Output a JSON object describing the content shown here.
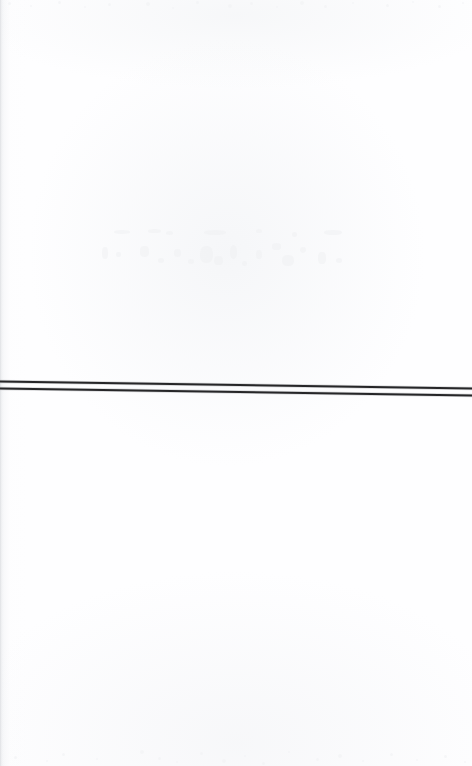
{
  "document": {
    "kind": "scanned-page",
    "page_background": "#fefeff",
    "width": 472,
    "height": 766,
    "visible_text": "",
    "note_text": ""
  },
  "rules": {
    "stroke_color": "#262628",
    "halo_color": "#b9babd",
    "count": 2,
    "lines": [
      {
        "name": "upper-rule",
        "x1": 0,
        "y1": 381.5,
        "x2": 472,
        "y2": 388.5,
        "thickness": 2.1
      },
      {
        "name": "lower-rule",
        "x1": 0,
        "y1": 388.5,
        "x2": 472,
        "y2": 395.5,
        "thickness": 2.1
      }
    ]
  },
  "artifacts": {
    "edge_strip_color": "#d6d8dc",
    "bleed_color": "#f0f1f3",
    "speckle_color": "#f1f2f4",
    "bleed_marks": [
      {
        "x": 18,
        "y": 2,
        "w": 16,
        "h": 4
      },
      {
        "x": 52,
        "y": 1,
        "w": 13,
        "h": 4
      },
      {
        "x": 70,
        "y": 3,
        "w": 7,
        "h": 4
      },
      {
        "x": 108,
        "y": 2,
        "w": 22,
        "h": 5
      },
      {
        "x": 160,
        "y": 1,
        "w": 6,
        "h": 4
      },
      {
        "x": 196,
        "y": 4,
        "w": 5,
        "h": 5
      },
      {
        "x": 228,
        "y": 2,
        "w": 18,
        "h": 5
      },
      {
        "x": 6,
        "y": 19,
        "w": 6,
        "h": 12
      },
      {
        "x": 20,
        "y": 24,
        "w": 5,
        "h": 5
      },
      {
        "x": 44,
        "y": 18,
        "w": 9,
        "h": 11
      },
      {
        "x": 62,
        "y": 30,
        "w": 6,
        "h": 5
      },
      {
        "x": 78,
        "y": 21,
        "w": 7,
        "h": 8
      },
      {
        "x": 92,
        "y": 31,
        "w": 6,
        "h": 5
      },
      {
        "x": 104,
        "y": 18,
        "w": 13,
        "h": 17
      },
      {
        "x": 118,
        "y": 28,
        "w": 9,
        "h": 9
      },
      {
        "x": 134,
        "y": 17,
        "w": 7,
        "h": 14
      },
      {
        "x": 146,
        "y": 33,
        "w": 5,
        "h": 5
      },
      {
        "x": 160,
        "y": 22,
        "w": 6,
        "h": 9
      },
      {
        "x": 176,
        "y": 15,
        "w": 9,
        "h": 7
      },
      {
        "x": 186,
        "y": 27,
        "w": 12,
        "h": 11
      },
      {
        "x": 204,
        "y": 19,
        "w": 6,
        "h": 6
      },
      {
        "x": 222,
        "y": 24,
        "w": 8,
        "h": 12
      },
      {
        "x": 240,
        "y": 30,
        "w": 6,
        "h": 5
      }
    ],
    "top_speckles": [
      {
        "x": 8,
        "y": 2,
        "d": 3
      },
      {
        "x": 30,
        "y": 5,
        "d": 2
      },
      {
        "x": 58,
        "y": 1,
        "d": 3
      },
      {
        "x": 84,
        "y": 6,
        "d": 2
      },
      {
        "x": 108,
        "y": 3,
        "d": 3
      },
      {
        "x": 146,
        "y": 2,
        "d": 4
      },
      {
        "x": 172,
        "y": 7,
        "d": 2
      },
      {
        "x": 196,
        "y": 1,
        "d": 3
      },
      {
        "x": 228,
        "y": 4,
        "d": 4
      },
      {
        "x": 250,
        "y": 2,
        "d": 3
      },
      {
        "x": 276,
        "y": 6,
        "d": 2
      },
      {
        "x": 300,
        "y": 1,
        "d": 4
      },
      {
        "x": 324,
        "y": 5,
        "d": 3
      },
      {
        "x": 352,
        "y": 2,
        "d": 2
      },
      {
        "x": 386,
        "y": 4,
        "d": 3
      },
      {
        "x": 412,
        "y": 1,
        "d": 2
      },
      {
        "x": 438,
        "y": 5,
        "d": 3
      },
      {
        "x": 462,
        "y": 2,
        "d": 2
      }
    ],
    "bottom_speckles": [
      {
        "x": 14,
        "y": 16,
        "d": 3
      },
      {
        "x": 46,
        "y": 20,
        "d": 2
      },
      {
        "x": 62,
        "y": 13,
        "d": 3
      },
      {
        "x": 96,
        "y": 18,
        "d": 2
      },
      {
        "x": 140,
        "y": 10,
        "d": 4
      },
      {
        "x": 158,
        "y": 17,
        "d": 3
      },
      {
        "x": 176,
        "y": 21,
        "d": 2
      },
      {
        "x": 200,
        "y": 12,
        "d": 3
      },
      {
        "x": 222,
        "y": 19,
        "d": 4
      },
      {
        "x": 244,
        "y": 15,
        "d": 2
      },
      {
        "x": 262,
        "y": 22,
        "d": 3
      },
      {
        "x": 288,
        "y": 11,
        "d": 2
      },
      {
        "x": 316,
        "y": 18,
        "d": 3
      },
      {
        "x": 338,
        "y": 14,
        "d": 4
      },
      {
        "x": 362,
        "y": 20,
        "d": 2
      },
      {
        "x": 390,
        "y": 13,
        "d": 3
      },
      {
        "x": 416,
        "y": 19,
        "d": 2
      },
      {
        "x": 444,
        "y": 15,
        "d": 3
      },
      {
        "x": 464,
        "y": 21,
        "d": 2
      }
    ]
  }
}
